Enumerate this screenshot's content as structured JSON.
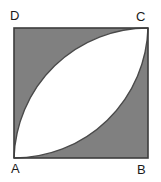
{
  "figure": {
    "kind": "geometry-diagram",
    "shape": "square",
    "labels": {
      "A": "A",
      "B": "B",
      "C": "C",
      "D": "D"
    },
    "colors": {
      "shaded_region": "#808080",
      "lens_region": "#ffffff",
      "outline": "#3c3c3c",
      "label_text": "#1a1a1a",
      "background": "#ffffff"
    },
    "square": {
      "x": 14,
      "y": 28,
      "side": 134,
      "stroke_width": 1.6
    },
    "vertices": {
      "A": {
        "x": 14,
        "y": 158,
        "position": "bottom-left"
      },
      "B": {
        "x": 148,
        "y": 158,
        "position": "bottom-right"
      },
      "C": {
        "x": 148,
        "y": 28,
        "position": "top-right"
      },
      "D": {
        "x": 14,
        "y": 28,
        "position": "top-left"
      }
    },
    "arcs": [
      {
        "name": "arc-centered-at-D",
        "center": "D",
        "radius": 134,
        "from": "A",
        "to": "C",
        "sweep": "quarter-circle"
      },
      {
        "name": "arc-centered-at-B",
        "center": "B",
        "radius": 134,
        "from": "C",
        "to": "A",
        "sweep": "quarter-circle"
      }
    ],
    "lens": {
      "name": "vesica-lens-AC",
      "endpoints": [
        "A",
        "C"
      ],
      "fill": "#ffffff"
    }
  }
}
